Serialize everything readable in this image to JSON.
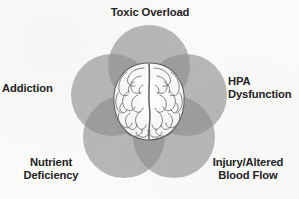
{
  "diagram": {
    "type": "venn-overlap",
    "center_figure": "brain-illustration",
    "background_color": "#fbfbfa",
    "circle_fill_color": "#8c8c8c",
    "circle_opacity": 0.62,
    "label_color": "#232323",
    "labels": {
      "top": "Toxic Overload",
      "left": "Addiction",
      "right": "HPA\nDysfunction",
      "bottom_left": "Nutrient\nDeficiency",
      "bottom_right": "Injury/Altered\nBlood Flow"
    },
    "circles": [
      {
        "name": "toxic-overload",
        "cx": 149,
        "cy": 66,
        "r": 41
      },
      {
        "name": "addiction",
        "cx": 112,
        "cy": 95,
        "r": 41
      },
      {
        "name": "hpa-dysfunction",
        "cx": 186,
        "cy": 95,
        "r": 41
      },
      {
        "name": "nutrient-deficiency",
        "cx": 124,
        "cy": 137,
        "r": 41
      },
      {
        "name": "injury-altered-blood-flow",
        "cx": 174,
        "cy": 137,
        "r": 41
      }
    ]
  }
}
